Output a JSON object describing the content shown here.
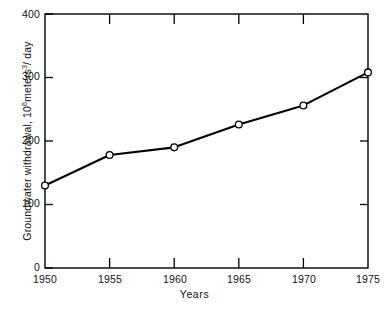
{
  "chart_data": {
    "type": "line",
    "title": "",
    "subtitle": "",
    "xlabel": "Years",
    "ylabel": "Groundwater withdrawal, 10^6 meters^3 / day",
    "ylabel_parts": {
      "prefix": "Groundwater withdrawal, 10",
      "exp1": "6",
      "mid": "meters",
      "exp2": "3",
      "suffix": "/ day"
    },
    "x": [
      1950,
      1955,
      1960,
      1965,
      1970,
      1975
    ],
    "categories": [
      "1950",
      "1955",
      "1960",
      "1965",
      "1970",
      "1975"
    ],
    "values": [
      130,
      178,
      190,
      226,
      256,
      308
    ],
    "series": [
      {
        "name": "Groundwater withdrawal",
        "values": [
          130,
          178,
          190,
          226,
          256,
          308
        ]
      }
    ],
    "xlim": [
      1950,
      1975
    ],
    "ylim": [
      0,
      400
    ],
    "ytick_labels": [
      "0",
      "100",
      "200",
      "300",
      "400"
    ],
    "ytick_values": [
      0,
      100,
      200,
      300,
      400
    ],
    "xtick_labels": [
      "1950",
      "1955",
      "1960",
      "1965",
      "1970",
      "1975"
    ],
    "xtick_values": [
      1950,
      1955,
      1960,
      1965,
      1970,
      1975
    ],
    "grid": false,
    "legend": false,
    "legend_position": "none",
    "marker": "open-circle",
    "line_color": "#000000",
    "marker_fill": "#ffffff",
    "background_color": "#ffffff",
    "frame": "box",
    "tick_direction": "in"
  },
  "axes": {
    "y_ticks": [
      {
        "label": "0",
        "value": 0
      },
      {
        "label": "100",
        "value": 100
      },
      {
        "label": "200",
        "value": 200
      },
      {
        "label": "300",
        "value": 300
      },
      {
        "label": "400",
        "value": 400
      }
    ],
    "x_ticks": [
      {
        "label": "1950",
        "value": 1950
      },
      {
        "label": "1955",
        "value": 1955
      },
      {
        "label": "1960",
        "value": 1960
      },
      {
        "label": "1965",
        "value": 1965
      },
      {
        "label": "1970",
        "value": 1970
      },
      {
        "label": "1975",
        "value": 1975
      }
    ]
  },
  "labels": {
    "xaxis_title": "Years"
  }
}
